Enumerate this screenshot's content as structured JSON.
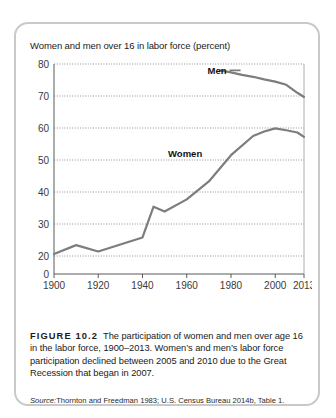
{
  "figure": {
    "card_border_color": "#c9c9c9",
    "background": "#ffffff",
    "figure_number": "FIGURE 10.2",
    "caption_text": "The participation of women and men over age 16 in the labor force, 1900–2013. Women’s and men’s labor force participation declined between 2005 and 2010 due to the Great Recession that began in 2007.",
    "source_label": "Source:",
    "source_text": "Thornton and Freedman 1983; U.S. Census Bureau 2014b, Table 1."
  },
  "chart_data": {
    "type": "line",
    "title": "Women and men over 16 in labor force (percent)",
    "xlabel": "",
    "ylabel": "",
    "xlim": [
      1900,
      2013
    ],
    "ylim": [
      0,
      80
    ],
    "grid": true,
    "grid_style": "dotted-horizontal",
    "legend": "inline-annotations",
    "y_ticks": [
      0,
      20,
      30,
      40,
      50,
      60,
      70,
      80
    ],
    "y_tick_labels": [
      "0",
      "20",
      "30",
      "40",
      "50",
      "60",
      "70",
      "80"
    ],
    "x_ticks": [
      1900,
      1920,
      1940,
      1960,
      1980,
      2000,
      2013
    ],
    "x_tick_labels": [
      "1900",
      "1920",
      "1940",
      "1960",
      "1980",
      "2000",
      "2013"
    ],
    "line_color": "#7d7d7d",
    "annotations": [
      {
        "text": "Men",
        "x": 1978,
        "y": 78
      },
      {
        "text": "Women",
        "x": 1967,
        "y": 52
      }
    ],
    "series": [
      {
        "name": "Men",
        "color": "#7d7d7d",
        "x": [
          1975,
          1980,
          1985,
          1990,
          1995,
          2000,
          2005,
          2010,
          2013
        ],
        "values": [
          78.0,
          77.4,
          76.6,
          76.0,
          75.2,
          74.5,
          73.5,
          71.0,
          69.7
        ]
      },
      {
        "name": "Women",
        "color": "#7d7d7d",
        "x": [
          1900,
          1910,
          1920,
          1930,
          1940,
          1945,
          1950,
          1960,
          1970,
          1980,
          1990,
          1995,
          2000,
          2005,
          2010,
          2013
        ],
        "values": [
          20.6,
          23.4,
          21.4,
          23.6,
          25.8,
          35.4,
          33.9,
          37.7,
          43.3,
          51.5,
          57.5,
          58.9,
          59.9,
          59.3,
          58.6,
          57.2
        ]
      }
    ]
  }
}
